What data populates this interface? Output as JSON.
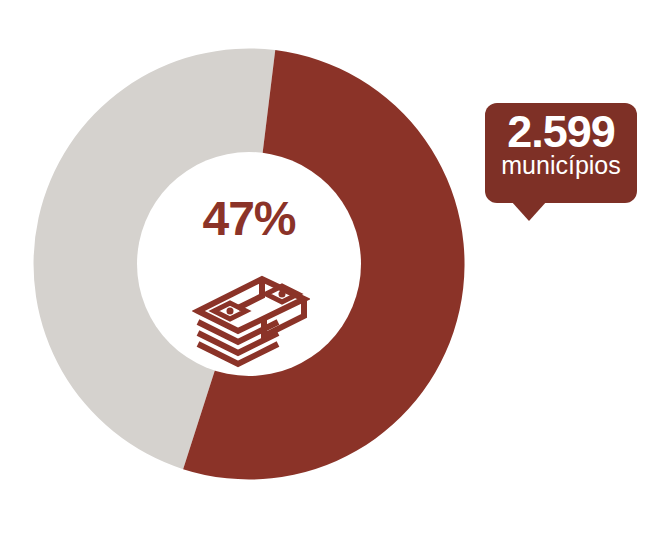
{
  "chart_data": {
    "type": "pie",
    "variant": "donut",
    "title": "",
    "subtitle": "",
    "xlabel": "",
    "ylabel": "",
    "legend_position": "none",
    "grid": false,
    "center_label": "47%",
    "center_icon": "money-stack-icon",
    "start_angle_deg": 7,
    "categories": [
      "Segmento destacado",
      "Restante"
    ],
    "values": [
      53,
      47
    ],
    "labels": [
      "",
      "47%"
    ],
    "colors": [
      "#8B3328",
      "#D5D2CE"
    ],
    "slices": [
      {
        "name": "Segmento destacado",
        "value": 53,
        "percent": 53,
        "color": "#8B3328",
        "label": ""
      },
      {
        "name": "Restante",
        "value": 47,
        "percent": 47,
        "color": "#D5D2CE",
        "label": "47%"
      }
    ],
    "annotations": [
      {
        "text": "2.599 municípios",
        "number": "2.599",
        "unit": "municípios",
        "target": "highlighted-slice",
        "style": "callout-bubble"
      }
    ]
  },
  "donut": {
    "center_percent": "47%",
    "segment_primary_color": "#8B3328",
    "segment_secondary_color": "#D5D2CE",
    "icon_name": "money-stack-icon"
  },
  "callout": {
    "number": "2.599",
    "unit": "municípios",
    "background_color": "#7E3026",
    "text_color": "#FFFFFF"
  },
  "colors": {
    "accent_red": "#8B3328",
    "badge_red": "#7E3026",
    "neutral_gray": "#D5D2CE",
    "background": "#FFFFFF"
  }
}
